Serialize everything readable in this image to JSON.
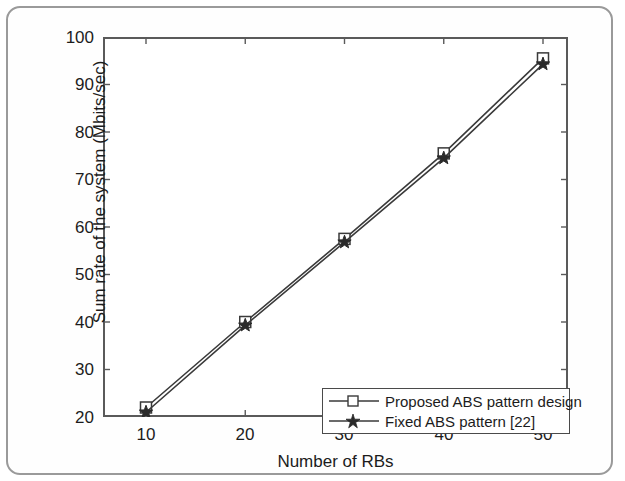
{
  "chart_data": {
    "type": "line",
    "title": "",
    "xlabel": "Number of RBs",
    "ylabel": "Sum rate of the system (Mbits/sec)",
    "x": [
      10,
      20,
      30,
      40,
      50
    ],
    "xticks": [
      "10",
      "20",
      "30",
      "40",
      "50"
    ],
    "yticks": [
      "20",
      "30",
      "40",
      "50",
      "60",
      "70",
      "80",
      "90",
      "100"
    ],
    "xlim": [
      5,
      52
    ],
    "ylim": [
      16,
      100
    ],
    "grid": false,
    "legend_position": "lower right",
    "series": [
      {
        "name": "Proposed ABS pattern design",
        "marker": "square",
        "color": "#3a3a3a",
        "values": [
          22.0,
          40.0,
          57.5,
          75.5,
          95.5
        ]
      },
      {
        "name": "Fixed ABS pattern [22]",
        "marker": "star",
        "color": "#3a3a3a",
        "values": [
          21.0,
          39.3,
          56.8,
          74.5,
          94.3
        ]
      }
    ]
  },
  "axes": {
    "ylabel": "Sum rate of the system (Mbits/sec)",
    "xlabel": "Number of RBs",
    "ytick_labels": [
      "100",
      "90",
      "80",
      "70",
      "60",
      "50",
      "40",
      "30",
      "20"
    ],
    "xtick_labels": [
      "10",
      "20",
      "30",
      "40",
      "50"
    ]
  },
  "legend": {
    "entries": [
      {
        "label": "Proposed ABS pattern design",
        "marker": "square-marker"
      },
      {
        "label": "Fixed ABS pattern [22]",
        "marker": "star-marker"
      }
    ]
  }
}
